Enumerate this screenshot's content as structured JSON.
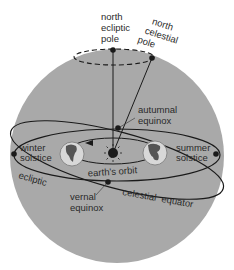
{
  "diagram": {
    "colors": {
      "sphere": "#a9a9a9",
      "line": "#1a1a1a",
      "background": "#ffffff",
      "text": "#2a2a2a"
    },
    "labels": {
      "north_ecliptic_pole": [
        "north",
        "ecliptic",
        "pole"
      ],
      "north_celestial_pole": [
        "north",
        "celestial",
        "pole"
      ],
      "autumnal_equinox": [
        "autumnal",
        "equinox"
      ],
      "winter_solstice": [
        "winter",
        "solstice"
      ],
      "summer_solstice": [
        "summer",
        "solstice"
      ],
      "earths_orbit": "earth's orbit",
      "ecliptic": "ecliptic",
      "vernal_equinox": [
        "vernal",
        "equinox"
      ],
      "celestial_equator": "celestial  equator"
    },
    "nodes": [
      {
        "id": "north-ecliptic-pole",
        "type": "point"
      },
      {
        "id": "north-celestial-pole",
        "type": "point"
      },
      {
        "id": "autumnal-equinox",
        "type": "point"
      },
      {
        "id": "vernal-equinox",
        "type": "point"
      },
      {
        "id": "winter-solstice",
        "type": "point"
      },
      {
        "id": "summer-solstice",
        "type": "point"
      },
      {
        "id": "sun",
        "type": "sun"
      },
      {
        "id": "earth-left",
        "type": "globe"
      },
      {
        "id": "earth-right",
        "type": "globe"
      }
    ],
    "edges": [
      {
        "from": "north-ecliptic-pole",
        "to": "sun",
        "style": "solid",
        "label": "ecliptic axis"
      },
      {
        "from": "north-celestial-pole",
        "to": "sun",
        "style": "solid",
        "label": "celestial axis"
      },
      {
        "from": "winter-solstice",
        "to": "summer-solstice",
        "style": "ellipse",
        "label": "ecliptic"
      },
      {
        "from": "autumnal-equinox",
        "to": "vernal-equinox",
        "style": "ellipse",
        "label": "celestial equator"
      },
      {
        "from": "earth-left",
        "to": "earth-right",
        "style": "ellipse-arrow",
        "label": "earth's orbit"
      }
    ]
  }
}
